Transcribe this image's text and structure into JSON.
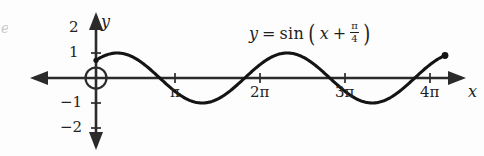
{
  "figure": {
    "background_color": "#fdfdfd",
    "ink_color": "#232323",
    "curve_color": "#1a1a1a",
    "edge_artifact": "e"
  },
  "equation": {
    "lhs": "y",
    "equals": "=",
    "function": "sin",
    "open_paren": "(",
    "argument_var": "x",
    "plus": "+",
    "fraction_numerator": "π",
    "fraction_denominator": "4",
    "close_paren": ")",
    "plain": "y = sin(x + π/4)"
  },
  "axes": {
    "x_axis_label": "x",
    "y_axis_label": "y",
    "origin_marker": "open-circle",
    "x_ticks": [
      {
        "label": "π",
        "value": 3.14159,
        "px": 175
      },
      {
        "label": "2π",
        "value": 6.28319,
        "px": 260
      },
      {
        "label": "3π",
        "value": 9.42478,
        "px": 345
      },
      {
        "label": "4π",
        "value": 12.56637,
        "px": 430
      }
    ],
    "y_ticks": [
      {
        "label": "2",
        "value": 2,
        "px": 28
      },
      {
        "label": "1",
        "value": 1,
        "px": 53
      },
      {
        "label": "−1",
        "value": -1,
        "px": 103
      },
      {
        "label": "−2",
        "value": -2,
        "px": 128
      }
    ]
  },
  "chart_data": {
    "type": "line",
    "title": "",
    "subtitle": "",
    "xlabel": "x",
    "ylabel": "y",
    "annotations": [
      "y = sin(x + π/4)"
    ],
    "legend": [],
    "legend_position": "none",
    "grid": false,
    "xlim": [
      -0.9,
      13.6
    ],
    "ylim": [
      -2.6,
      2.6
    ],
    "xtick_labels": [
      "π",
      "2π",
      "3π",
      "4π"
    ],
    "xtick_values": [
      3.14159,
      6.28319,
      9.42478,
      12.56637
    ],
    "ytick_labels": [
      "2",
      "1",
      "−1",
      "−2"
    ],
    "ytick_values": [
      2,
      1,
      -1,
      -2
    ],
    "series": [
      {
        "name": "y = sin(x + π/4)",
        "formula": "sin(x + pi/4)",
        "amplitude": 1,
        "period": 6.28319,
        "phase_shift": 0.7854,
        "domain": [
          0,
          12.9
        ],
        "start_point": {
          "x": 0,
          "y": 0.707,
          "marker": "dot"
        },
        "end_point": {
          "x": 12.9,
          "y": 0.93,
          "marker": "filled-dot"
        },
        "key_points": [
          {
            "x": 0,
            "y": 0.707,
            "kind": "start"
          },
          {
            "x": 0.7854,
            "y": 1,
            "kind": "maximum"
          },
          {
            "x": 2.356,
            "y": 0,
            "kind": "zero-crossing"
          },
          {
            "x": 3.927,
            "y": -1,
            "kind": "minimum"
          },
          {
            "x": 5.498,
            "y": 0,
            "kind": "zero-crossing"
          },
          {
            "x": 7.069,
            "y": 1,
            "kind": "maximum"
          },
          {
            "x": 8.639,
            "y": 0,
            "kind": "zero-crossing"
          },
          {
            "x": 10.21,
            "y": -1,
            "kind": "minimum"
          },
          {
            "x": 11.781,
            "y": 0,
            "kind": "zero-crossing"
          },
          {
            "x": 12.9,
            "y": 0.93,
            "kind": "end"
          }
        ],
        "values": [
          0.707,
          0.891,
          0.988,
          0.992,
          0.904,
          0.733,
          0.496,
          0.214,
          -0.087,
          -0.38,
          -0.637,
          -0.835,
          -0.958,
          -0.996,
          -0.946,
          -0.813,
          -0.608,
          -0.35,
          -0.06,
          0.236,
          0.512,
          0.745,
          0.915,
          1.0,
          0.995,
          0.9,
          0.723,
          0.481,
          0.197
        ],
        "x": [
          0.0,
          0.45,
          0.9,
          1.35,
          1.8,
          2.25,
          2.7,
          3.15,
          3.6,
          4.05,
          4.5,
          4.95,
          5.4,
          5.85,
          6.3,
          6.75,
          7.2,
          7.65,
          8.1,
          8.55,
          9.0,
          9.45,
          9.9,
          10.35,
          10.8,
          11.25,
          11.7,
          12.15,
          12.6
        ]
      }
    ]
  }
}
